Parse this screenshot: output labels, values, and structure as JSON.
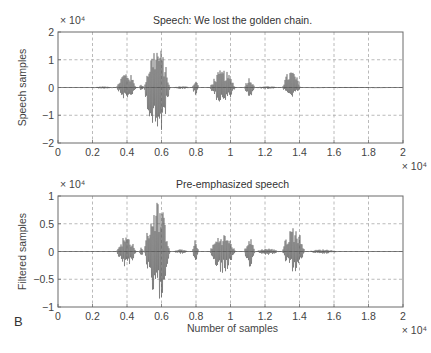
{
  "panel_label": "B",
  "chart_data": [
    {
      "type": "line",
      "title": "Speech: We lost the golden chain.",
      "xlabel": "",
      "ylabel": "Speech samples",
      "x_multiplier": "× 10⁴",
      "y_multiplier": "× 10⁴",
      "xlim": [
        0,
        2
      ],
      "ylim": [
        -2,
        2
      ],
      "xticks": [
        0,
        0.2,
        0.4,
        0.6,
        0.8,
        1,
        1.2,
        1.4,
        1.6,
        1.8,
        2
      ],
      "xtick_labels": [
        "0",
        "0.2",
        "0.4",
        "0.6",
        "0.8",
        "1",
        "1.2",
        "1.4",
        "1.6",
        "1.8",
        "2"
      ],
      "yticks": [
        -2,
        -1,
        0,
        1,
        2
      ],
      "ytick_labels": [
        "−2",
        "−1",
        "0",
        "1",
        "2"
      ],
      "grid": true,
      "series": [
        {
          "name": "speech waveform",
          "color": "#5e5e5e",
          "bursts": [
            {
              "x_start": 0.2,
              "x_end": 0.34,
              "max": 0.04,
              "min": -0.04
            },
            {
              "x_start": 0.34,
              "x_end": 0.47,
              "max": 0.6,
              "min": -0.45
            },
            {
              "x_start": 0.47,
              "x_end": 0.5,
              "max": 0.12,
              "min": -0.12
            },
            {
              "x_start": 0.5,
              "x_end": 0.67,
              "max": 1.55,
              "min": -1.85
            },
            {
              "x_start": 0.67,
              "x_end": 0.78,
              "max": 0.05,
              "min": -0.05
            },
            {
              "x_start": 0.78,
              "x_end": 0.82,
              "max": 0.3,
              "min": -0.3
            },
            {
              "x_start": 0.88,
              "x_end": 1.05,
              "max": 0.65,
              "min": -0.6
            },
            {
              "x_start": 1.08,
              "x_end": 1.15,
              "max": 0.38,
              "min": -0.38
            },
            {
              "x_start": 1.15,
              "x_end": 1.3,
              "max": 0.05,
              "min": -0.05
            },
            {
              "x_start": 1.3,
              "x_end": 1.42,
              "max": 0.65,
              "min": -0.35
            },
            {
              "x_start": 1.42,
              "x_end": 2.0,
              "max": 0.02,
              "min": -0.02
            }
          ]
        }
      ]
    },
    {
      "type": "line",
      "title": "Pre-emphasized speech",
      "xlabel": "Number of samples",
      "ylabel": "Filtered samples",
      "x_multiplier": "× 10⁴",
      "y_multiplier": "× 10⁴",
      "xlim": [
        0,
        2
      ],
      "ylim": [
        -1,
        1
      ],
      "xticks": [
        0,
        0.2,
        0.4,
        0.6,
        0.8,
        1,
        1.2,
        1.4,
        1.6,
        1.8,
        2
      ],
      "xtick_labels": [
        "0",
        "0.2",
        "0.4",
        "0.6",
        "0.8",
        "1",
        "1.2",
        "1.4",
        "1.6",
        "1.8",
        "2"
      ],
      "yticks": [
        -1,
        -0.5,
        0,
        0.5,
        1
      ],
      "ytick_labels": [
        "−1",
        "−0.5",
        "0",
        "0.5",
        "1"
      ],
      "grid": true,
      "series": [
        {
          "name": "pre-emphasized waveform",
          "color": "#5e5e5e",
          "bursts": [
            {
              "x_start": 0.34,
              "x_end": 0.47,
              "max": 0.3,
              "min": -0.28
            },
            {
              "x_start": 0.47,
              "x_end": 0.5,
              "max": 0.08,
              "min": -0.08
            },
            {
              "x_start": 0.5,
              "x_end": 0.67,
              "max": 0.95,
              "min": -0.95
            },
            {
              "x_start": 0.67,
              "x_end": 0.77,
              "max": 0.04,
              "min": -0.04
            },
            {
              "x_start": 0.78,
              "x_end": 0.82,
              "max": 0.22,
              "min": -0.2
            },
            {
              "x_start": 0.88,
              "x_end": 1.05,
              "max": 0.33,
              "min": -0.4
            },
            {
              "x_start": 1.08,
              "x_end": 1.15,
              "max": 0.25,
              "min": -0.28
            },
            {
              "x_start": 1.15,
              "x_end": 1.3,
              "max": 0.06,
              "min": -0.06
            },
            {
              "x_start": 1.3,
              "x_end": 1.45,
              "max": 0.48,
              "min": -0.38
            },
            {
              "x_start": 1.45,
              "x_end": 1.65,
              "max": 0.04,
              "min": -0.04
            }
          ]
        }
      ]
    }
  ]
}
